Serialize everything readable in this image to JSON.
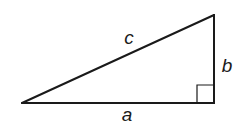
{
  "diagram": {
    "type": "right-triangle",
    "labels": {
      "hypotenuse": "c",
      "vertical_leg": "b",
      "horizontal_leg": "a"
    },
    "right_angle_marker": true,
    "colors": {
      "stroke": "#1a1a1a",
      "background": "#ffffff"
    }
  }
}
